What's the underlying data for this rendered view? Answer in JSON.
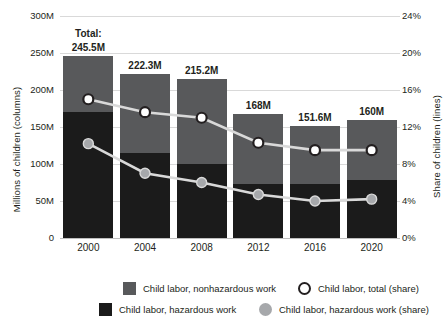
{
  "chart_data": {
    "type": "bar",
    "title": "",
    "categories": [
      "2000",
      "2004",
      "2008",
      "2012",
      "2016",
      "2020"
    ],
    "xlabel": "",
    "ylabel": "Millions of children (columns)",
    "y2label": "Share of children (lines)",
    "ylim": [
      0,
      300
    ],
    "y2lim": [
      0,
      24
    ],
    "yticks": [
      "0",
      "50M",
      "100M",
      "150M",
      "200M",
      "250M",
      "300M"
    ],
    "ytick_values": [
      0,
      50,
      100,
      150,
      200,
      250,
      300
    ],
    "y2ticks": [
      "0%",
      "4%",
      "8%",
      "12%",
      "16%",
      "20%",
      "24%"
    ],
    "y2tick_values": [
      0,
      4,
      8,
      12,
      16,
      20,
      24
    ],
    "grid": true,
    "legend_position": "bottom",
    "stacked": true,
    "bar_labels": [
      "245.5M",
      "222.3M",
      "215.2M",
      "168M",
      "151.6M",
      "160M"
    ],
    "total_prefix": "Total:",
    "series": [
      {
        "name": "Child labor, hazardous work",
        "kind": "bar",
        "axis": "left",
        "color": "#1b1b1b",
        "values": [
          170.0,
          115.0,
          100.0,
          73.0,
          73.0,
          79.0
        ]
      },
      {
        "name": "Child labor, nonhazardous work",
        "kind": "bar",
        "axis": "left",
        "color": "#58595b",
        "values": [
          75.5,
          107.3,
          115.2,
          95.0,
          78.6,
          81.0
        ]
      },
      {
        "name": "Child labor, total (share)",
        "kind": "line",
        "axis": "right",
        "marker": "open-circle",
        "color": "#d9d9d9",
        "marker_fill": "#ffffff",
        "marker_edge": "#231f20",
        "values": [
          15.0,
          13.6,
          13.0,
          10.3,
          9.5,
          9.5
        ]
      },
      {
        "name": "Child labor, hazardous work (share)",
        "kind": "line",
        "axis": "right",
        "marker": "filled-circle",
        "color": "#d9d9d9",
        "marker_fill": "#a6a8ab",
        "marker_edge": "#d9d9d9",
        "values": [
          10.2,
          7.0,
          6.0,
          4.7,
          4.0,
          4.2
        ]
      }
    ],
    "totals": [
      245.5,
      222.3,
      215.2,
      168.0,
      151.6,
      160.0
    ]
  },
  "legend": {
    "items": [
      {
        "label": "Child labor, nonhazardous work",
        "marker": "square-gray"
      },
      {
        "label": "Child labor, total (share)",
        "marker": "open-circle"
      },
      {
        "label": "Child labor, hazardous work",
        "marker": "square-black"
      },
      {
        "label": "Child labor, hazardous work (share)",
        "marker": "filled-circle-gray"
      }
    ]
  },
  "colors": {
    "nonhazardous": "#58595b",
    "hazardous": "#1b1b1b",
    "line": "#d9d9d9",
    "marker_open_fill": "#ffffff",
    "marker_open_edge": "#231f20",
    "marker_filled": "#a6a8ab",
    "grid": "#d9d9d9",
    "text": "#231f20",
    "background": "#ffffff"
  }
}
